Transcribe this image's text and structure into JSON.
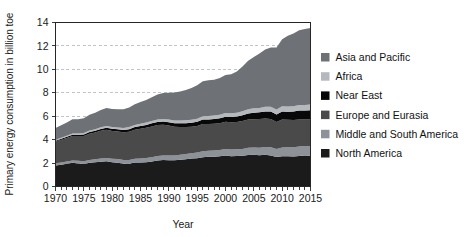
{
  "chart_data": {
    "type": "area",
    "stacked": true,
    "title": "",
    "xlabel": "Year",
    "ylabel": "Primary energy consumption in billion toe",
    "xlim": [
      1970,
      2015
    ],
    "ylim": [
      0,
      14
    ],
    "ytick_labels": [
      "0",
      "2",
      "4",
      "6",
      "8",
      "10",
      "12",
      "14"
    ],
    "yticks": [
      0,
      2,
      4,
      6,
      8,
      10,
      12,
      14
    ],
    "xtick_labels": [
      "1970",
      "1975",
      "1980",
      "1985",
      "1990",
      "1995",
      "2000",
      "2005",
      "2010",
      "2015"
    ],
    "xticks": [
      1970,
      1975,
      1980,
      1985,
      1990,
      1995,
      2000,
      2005,
      2010,
      2015
    ],
    "minor_xtick_step": 1,
    "grid": "horizontal-dashed",
    "legend_position": "right",
    "x": [
      1970,
      1971,
      1972,
      1973,
      1974,
      1975,
      1976,
      1977,
      1978,
      1979,
      1980,
      1981,
      1982,
      1983,
      1984,
      1985,
      1986,
      1987,
      1988,
      1989,
      1990,
      1991,
      1992,
      1993,
      1994,
      1995,
      1996,
      1997,
      1998,
      1999,
      2000,
      2001,
      2002,
      2003,
      2004,
      2005,
      2006,
      2007,
      2008,
      2009,
      2010,
      2011,
      2012,
      2013,
      2014,
      2015
    ],
    "series": [
      {
        "name": "North America",
        "color": "#1b1b1b",
        "values": [
          1.8,
          1.86,
          1.94,
          2.02,
          1.97,
          1.93,
          2.02,
          2.07,
          2.12,
          2.15,
          2.07,
          2.03,
          1.95,
          1.95,
          2.04,
          2.05,
          2.07,
          2.13,
          2.22,
          2.26,
          2.25,
          2.24,
          2.29,
          2.33,
          2.38,
          2.42,
          2.5,
          2.53,
          2.54,
          2.58,
          2.65,
          2.59,
          2.61,
          2.63,
          2.69,
          2.7,
          2.66,
          2.7,
          2.64,
          2.51,
          2.59,
          2.58,
          2.56,
          2.61,
          2.64,
          2.63
        ]
      },
      {
        "name": "Middle and South America",
        "color": "#8d9298",
        "values": [
          0.18,
          0.19,
          0.2,
          0.21,
          0.22,
          0.23,
          0.25,
          0.26,
          0.28,
          0.29,
          0.3,
          0.31,
          0.31,
          0.32,
          0.33,
          0.34,
          0.36,
          0.37,
          0.38,
          0.39,
          0.4,
          0.41,
          0.43,
          0.44,
          0.46,
          0.48,
          0.5,
          0.52,
          0.53,
          0.54,
          0.56,
          0.56,
          0.57,
          0.58,
          0.61,
          0.63,
          0.65,
          0.68,
          0.7,
          0.7,
          0.74,
          0.76,
          0.78,
          0.8,
          0.81,
          0.81
        ]
      },
      {
        "name": "Europe and Eurasia",
        "color": "#4a4a4a",
        "values": [
          1.86,
          1.94,
          2.01,
          2.09,
          2.12,
          2.16,
          2.24,
          2.28,
          2.35,
          2.4,
          2.37,
          2.35,
          2.37,
          2.41,
          2.48,
          2.54,
          2.58,
          2.63,
          2.64,
          2.62,
          2.55,
          2.46,
          2.35,
          2.3,
          2.25,
          2.27,
          2.34,
          2.29,
          2.29,
          2.28,
          2.31,
          2.33,
          2.32,
          2.38,
          2.41,
          2.42,
          2.45,
          2.42,
          2.43,
          2.29,
          2.39,
          2.35,
          2.33,
          2.32,
          2.26,
          2.27
        ]
      },
      {
        "name": "Near East",
        "color": "#080808",
        "values": [
          0.07,
          0.08,
          0.09,
          0.1,
          0.11,
          0.12,
          0.14,
          0.15,
          0.16,
          0.17,
          0.18,
          0.19,
          0.2,
          0.21,
          0.23,
          0.24,
          0.25,
          0.26,
          0.27,
          0.28,
          0.29,
          0.3,
          0.32,
          0.33,
          0.35,
          0.36,
          0.38,
          0.39,
          0.41,
          0.42,
          0.44,
          0.45,
          0.47,
          0.49,
          0.52,
          0.55,
          0.57,
          0.6,
          0.63,
          0.65,
          0.68,
          0.7,
          0.73,
          0.75,
          0.77,
          0.79
        ]
      },
      {
        "name": "Africa",
        "color": "#b5b9bd",
        "values": [
          0.09,
          0.1,
          0.1,
          0.11,
          0.11,
          0.12,
          0.13,
          0.13,
          0.14,
          0.15,
          0.16,
          0.16,
          0.17,
          0.18,
          0.18,
          0.19,
          0.2,
          0.21,
          0.21,
          0.22,
          0.23,
          0.23,
          0.24,
          0.25,
          0.25,
          0.26,
          0.27,
          0.28,
          0.29,
          0.3,
          0.31,
          0.32,
          0.33,
          0.34,
          0.36,
          0.37,
          0.38,
          0.4,
          0.41,
          0.42,
          0.44,
          0.44,
          0.46,
          0.47,
          0.48,
          0.49
        ]
      },
      {
        "name": "Asia and Pacific",
        "color": "#6e7277",
        "values": [
          1.0,
          1.06,
          1.12,
          1.21,
          1.22,
          1.27,
          1.34,
          1.41,
          1.48,
          1.54,
          1.54,
          1.56,
          1.6,
          1.67,
          1.76,
          1.85,
          1.92,
          2.02,
          2.13,
          2.22,
          2.28,
          2.38,
          2.47,
          2.59,
          2.71,
          2.85,
          2.99,
          3.07,
          3.06,
          3.14,
          3.24,
          3.33,
          3.52,
          3.82,
          4.14,
          4.38,
          4.64,
          4.9,
          5.05,
          5.29,
          5.72,
          6.03,
          6.21,
          6.38,
          6.49,
          6.53
        ]
      }
    ]
  },
  "legend": {
    "items": [
      {
        "label": "Asia and Pacific",
        "color": "#6e7277"
      },
      {
        "label": "Africa",
        "color": "#b5b9bd"
      },
      {
        "label": "Near East",
        "color": "#080808"
      },
      {
        "label": "Europe and Eurasia",
        "color": "#4a4a4a"
      },
      {
        "label": "Middle and South America",
        "color": "#8d9298"
      },
      {
        "label": "North America",
        "color": "#1b1b1b"
      }
    ]
  },
  "colors": {
    "background": "#ffffff",
    "axis": "#262626",
    "grid": "#b9bec4",
    "text": "#1a1a1a"
  }
}
